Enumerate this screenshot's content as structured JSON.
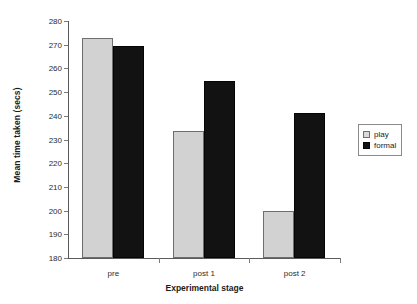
{
  "chart_data": {
    "type": "bar",
    "title": "",
    "xlabel": "Experimental stage",
    "ylabel": "Mean time taken (secs)",
    "categories": [
      "pre",
      "post 1",
      "post 2"
    ],
    "series": [
      {
        "name": "play",
        "values": [
          273,
          233.5,
          200
        ],
        "color": "#d2d2d2"
      },
      {
        "name": "formal",
        "values": [
          269.5,
          254.8,
          241
        ],
        "color": "#121212"
      }
    ],
    "ylim": [
      180,
      280
    ],
    "yticks": [
      180,
      190,
      200,
      210,
      220,
      230,
      240,
      250,
      260,
      270,
      280
    ],
    "grid": false,
    "legend_position": "right"
  },
  "legend": {
    "entries": [
      {
        "label": "play",
        "swatch": "light-gray-square"
      },
      {
        "label": "formal",
        "swatch": "black-square"
      }
    ]
  }
}
